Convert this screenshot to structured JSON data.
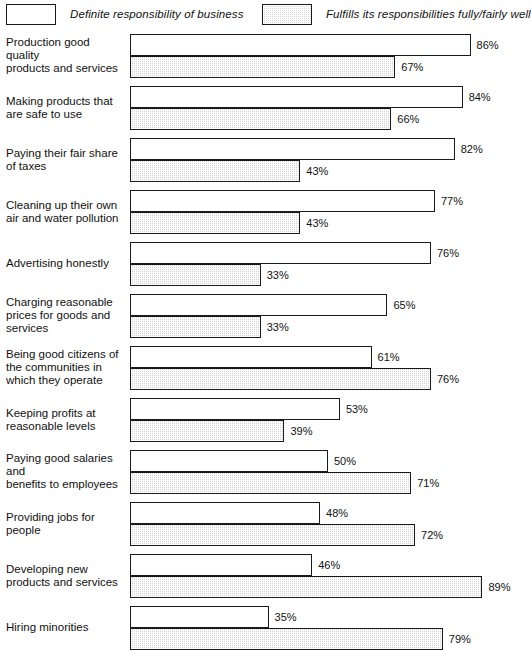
{
  "legend": {
    "entries": [
      {
        "label": "Definite responsibility of business",
        "swatch": "open-rectangle-icon"
      },
      {
        "label": "Fulfills its responsibilities fully/fairly well",
        "swatch": "hatched-rectangle-icon"
      }
    ]
  },
  "chart_data": {
    "type": "bar",
    "orientation": "horizontal",
    "title": "",
    "subtitle": "",
    "xlabel": "",
    "ylabel": "",
    "xlim": [
      0,
      100
    ],
    "grid": false,
    "legend_position": "top",
    "value_suffix": "%",
    "categories": [
      "Production good quality products and services",
      "Making products that are safe to use",
      "Paying their fair share of taxes",
      "Cleaning up their own air and water pollution",
      "Advertising honestly",
      "Charging reasonable prices for goods and services",
      "Being good citizens of the communities in which they operate",
      "Keeping profits at reasonable levels",
      "Paying good salaries and benefits to employees",
      "Providing jobs for people",
      "Developing new products and services",
      "Hiring minorities"
    ],
    "series": [
      {
        "name": "Definite responsibility of business",
        "style": "open",
        "values": [
          86,
          84,
          82,
          77,
          76,
          65,
          61,
          53,
          50,
          48,
          46,
          35
        ]
      },
      {
        "name": "Fulfills its responsibilities fully/fairly well",
        "style": "hatched",
        "values": [
          67,
          66,
          43,
          43,
          33,
          33,
          76,
          39,
          71,
          72,
          89,
          79
        ]
      }
    ]
  },
  "rows": [
    {
      "label_lines": [
        "Production good quality",
        "products and services"
      ],
      "open": "86%",
      "hatched": "67%"
    },
    {
      "label_lines": [
        "Making products that",
        "are safe to use"
      ],
      "open": "84%",
      "hatched": "66%"
    },
    {
      "label_lines": [
        "Paying their fair share",
        "of taxes"
      ],
      "open": "82%",
      "hatched": "43%"
    },
    {
      "label_lines": [
        "Cleaning up their own",
        "air and water pollution"
      ],
      "open": "77%",
      "hatched": "43%"
    },
    {
      "label_lines": [
        "Advertising honestly"
      ],
      "open": "76%",
      "hatched": "33%"
    },
    {
      "label_lines": [
        "Charging reasonable",
        "prices for goods and",
        "services"
      ],
      "open": "65%",
      "hatched": "33%"
    },
    {
      "label_lines": [
        "Being good citizens of",
        "the communities in",
        "which they operate"
      ],
      "open": "61%",
      "hatched": "76%"
    },
    {
      "label_lines": [
        "Keeping profits at",
        "reasonable levels"
      ],
      "open": "53%",
      "hatched": "39%"
    },
    {
      "label_lines": [
        "Paying good salaries and",
        "benefits to employees"
      ],
      "open": "50%",
      "hatched": "71%"
    },
    {
      "label_lines": [
        "Providing jobs for people"
      ],
      "open": "48%",
      "hatched": "72%"
    },
    {
      "label_lines": [
        "Developing new",
        "products and services"
      ],
      "open": "46%",
      "hatched": "89%"
    },
    {
      "label_lines": [
        "Hiring minorities"
      ],
      "open": "35%",
      "hatched": "79%"
    }
  ]
}
